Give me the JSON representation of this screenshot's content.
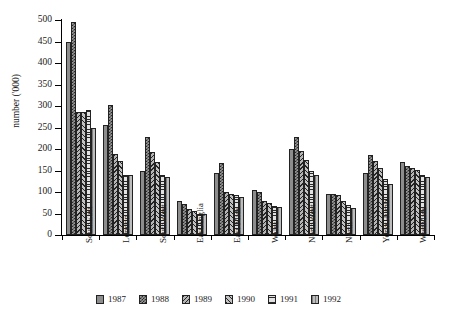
{
  "chart_data": {
    "type": "bar",
    "title": "",
    "subtitle": "",
    "xlabel": "",
    "ylabel": "number ('000)",
    "ylim": [
      0,
      500
    ],
    "ytick_values": [
      0,
      50,
      100,
      150,
      200,
      250,
      300,
      350,
      400,
      450,
      500
    ],
    "ytick_labels": [
      "0",
      "50",
      "100",
      "150",
      "200",
      "250",
      "300",
      "350",
      "400",
      "450",
      "500"
    ],
    "grid": false,
    "legend_position": "bottom",
    "categories": [
      "SouthEast",
      "London",
      "SouthWest",
      "EastAnglia",
      "East Mids",
      "Wales",
      "NorthWest",
      "North",
      "YorksHumb",
      "WestMids"
    ],
    "series": [
      {
        "name": "1987",
        "pattern": "dense-dotted-dark",
        "values": [
          450,
          255,
          150,
          80,
          145,
          105,
          200,
          95,
          145,
          170
        ]
      },
      {
        "name": "1988",
        "pattern": "checker-cross",
        "values": [
          495,
          302,
          228,
          72,
          168,
          100,
          228,
          95,
          185,
          160
        ]
      },
      {
        "name": "1989",
        "pattern": "diagonal-hatch-left",
        "values": [
          287,
          188,
          192,
          60,
          100,
          78,
          195,
          92,
          172,
          155
        ]
      },
      {
        "name": "1990",
        "pattern": "diagonal-hatch-right",
        "values": [
          285,
          172,
          170,
          57,
          95,
          75,
          175,
          80,
          155,
          152
        ]
      },
      {
        "name": "1991",
        "pattern": "horizontal-lines",
        "values": [
          290,
          140,
          140,
          48,
          92,
          68,
          148,
          70,
          130,
          140
        ]
      },
      {
        "name": "1992",
        "pattern": "light-grey",
        "values": [
          250,
          140,
          135,
          50,
          88,
          65,
          140,
          62,
          118,
          135
        ]
      }
    ]
  },
  "legend": {
    "items": [
      {
        "label": "1987"
      },
      {
        "label": "1988"
      },
      {
        "label": "1989"
      },
      {
        "label": "1990"
      },
      {
        "label": "1991"
      },
      {
        "label": "1992"
      }
    ]
  },
  "colors": {
    "axis": "#000000",
    "background": "#ffffff",
    "text": "#1a1a1a"
  }
}
